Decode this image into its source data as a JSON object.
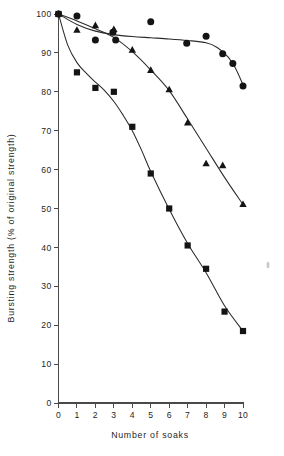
{
  "chart_data": {
    "type": "scatter",
    "title": "",
    "subtitle": "",
    "xlabel": "Number of soaks",
    "ylabel": "Bursting strength (% of original strength)",
    "xlim": [
      0,
      10
    ],
    "ylim": [
      0,
      100
    ],
    "xticks": [
      0,
      1,
      2,
      3,
      4,
      5,
      6,
      7,
      8,
      9,
      10
    ],
    "xtick_labels": [
      "0",
      "1",
      "2",
      "3",
      "4",
      "5",
      "6",
      "7",
      "8",
      "9",
      "10"
    ],
    "yticks": [
      0,
      10,
      20,
      30,
      40,
      50,
      60,
      70,
      80,
      90,
      100
    ],
    "ytick_labels": [
      "0",
      "10",
      "20",
      "30",
      "40",
      "50",
      "60",
      "70",
      "80",
      "90",
      "100"
    ],
    "grid": false,
    "legend": false,
    "legend_position": "none",
    "marker_colors": {
      "circle": "#141414",
      "triangle": "#141414",
      "square": "#141414",
      "line": "#2b2b2b",
      "axis": "#4a4a4a",
      "background": "#ffffff"
    },
    "series": [
      {
        "name": "circle",
        "marker": "circle",
        "points": [
          {
            "x": 0.0,
            "y": 100.0
          },
          {
            "x": 1.0,
            "y": 99.5
          },
          {
            "x": 2.0,
            "y": 93.3
          },
          {
            "x": 2.95,
            "y": 95.3
          },
          {
            "x": 3.1,
            "y": 93.3
          },
          {
            "x": 5.0,
            "y": 98.0
          },
          {
            "x": 6.95,
            "y": 92.5
          },
          {
            "x": 8.0,
            "y": 94.3
          },
          {
            "x": 8.9,
            "y": 89.8
          },
          {
            "x": 9.45,
            "y": 87.3
          },
          {
            "x": 10.0,
            "y": 81.5
          }
        ],
        "fit_line": [
          {
            "x": 0.0,
            "y": 100.0
          },
          {
            "x": 1.0,
            "y": 97.3
          },
          {
            "x": 2.0,
            "y": 95.6
          },
          {
            "x": 3.0,
            "y": 94.7
          },
          {
            "x": 4.0,
            "y": 94.2
          },
          {
            "x": 5.0,
            "y": 93.9
          },
          {
            "x": 6.0,
            "y": 93.6
          },
          {
            "x": 7.0,
            "y": 93.2
          },
          {
            "x": 8.0,
            "y": 92.6
          },
          {
            "x": 8.6,
            "y": 91.4
          },
          {
            "x": 9.2,
            "y": 88.9
          },
          {
            "x": 9.6,
            "y": 86.0
          },
          {
            "x": 10.0,
            "y": 81.8
          }
        ]
      },
      {
        "name": "triangle",
        "marker": "triangle",
        "points": [
          {
            "x": 0.0,
            "y": 100.0
          },
          {
            "x": 1.0,
            "y": 95.8
          },
          {
            "x": 2.0,
            "y": 97.0
          },
          {
            "x": 3.0,
            "y": 96.0
          },
          {
            "x": 4.0,
            "y": 90.7
          },
          {
            "x": 5.0,
            "y": 85.5
          },
          {
            "x": 6.0,
            "y": 80.5
          },
          {
            "x": 7.0,
            "y": 72.0
          },
          {
            "x": 8.0,
            "y": 61.5
          },
          {
            "x": 8.9,
            "y": 61.0
          },
          {
            "x": 10.0,
            "y": 51.0
          }
        ],
        "fit_line": [
          {
            "x": 0.0,
            "y": 100.0
          },
          {
            "x": 1.0,
            "y": 98.2
          },
          {
            "x": 2.0,
            "y": 96.2
          },
          {
            "x": 3.0,
            "y": 94.0
          },
          {
            "x": 4.0,
            "y": 90.3
          },
          {
            "x": 5.0,
            "y": 85.6
          },
          {
            "x": 6.0,
            "y": 80.3
          },
          {
            "x": 7.0,
            "y": 73.0
          },
          {
            "x": 8.0,
            "y": 65.5
          },
          {
            "x": 9.0,
            "y": 58.0
          },
          {
            "x": 10.0,
            "y": 51.0
          }
        ]
      },
      {
        "name": "square",
        "marker": "square",
        "points": [
          {
            "x": 0.0,
            "y": 100.0
          },
          {
            "x": 1.0,
            "y": 85.0
          },
          {
            "x": 2.0,
            "y": 81.0
          },
          {
            "x": 3.0,
            "y": 80.0
          },
          {
            "x": 4.0,
            "y": 71.0
          },
          {
            "x": 5.0,
            "y": 59.0
          },
          {
            "x": 6.0,
            "y": 50.0
          },
          {
            "x": 7.0,
            "y": 40.5
          },
          {
            "x": 8.0,
            "y": 34.5
          },
          {
            "x": 9.0,
            "y": 23.5
          },
          {
            "x": 10.0,
            "y": 18.5
          }
        ],
        "fit_line": [
          {
            "x": 0.0,
            "y": 100.0
          },
          {
            "x": 0.5,
            "y": 92.0
          },
          {
            "x": 1.0,
            "y": 87.5
          },
          {
            "x": 1.5,
            "y": 84.8
          },
          {
            "x": 2.0,
            "y": 82.5
          },
          {
            "x": 2.5,
            "y": 80.3
          },
          {
            "x": 3.0,
            "y": 77.5
          },
          {
            "x": 3.5,
            "y": 74.0
          },
          {
            "x": 4.0,
            "y": 70.0
          },
          {
            "x": 4.5,
            "y": 65.0
          },
          {
            "x": 5.0,
            "y": 59.5
          },
          {
            "x": 6.0,
            "y": 49.8
          },
          {
            "x": 7.0,
            "y": 41.0
          },
          {
            "x": 8.0,
            "y": 33.5
          },
          {
            "x": 9.0,
            "y": 25.0
          },
          {
            "x": 10.0,
            "y": 18.5
          }
        ]
      }
    ]
  }
}
